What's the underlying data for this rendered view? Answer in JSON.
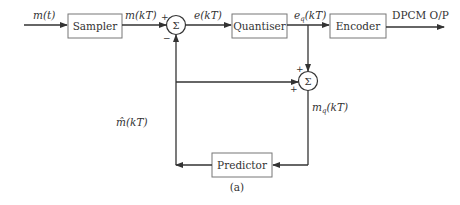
{
  "diagram": {
    "caption": "(a)",
    "blocks": {
      "sampler": "Sampler",
      "quantiser": "Quantiser",
      "encoder": "Encoder",
      "predictor": "Predictor"
    },
    "summers": {
      "sum1": {
        "symbol": "Σ",
        "sign_top": "+",
        "sign_bottom": "−"
      },
      "sum2": {
        "symbol": "Σ",
        "sign_top": "+",
        "sign_left": "+"
      }
    },
    "signals": {
      "input": "m(t)",
      "sampled": "m(kT)",
      "error": "e(kT)",
      "quantised_error_base": "e",
      "quantised_error_sub": "q",
      "quantised_error_arg": "(kT)",
      "predicted_base": "m̂",
      "predicted_arg": "(kT)",
      "quantised_sample_base": "m",
      "quantised_sample_sub": "q",
      "quantised_sample_arg": "(kT)",
      "output": "DPCM O/P"
    }
  }
}
